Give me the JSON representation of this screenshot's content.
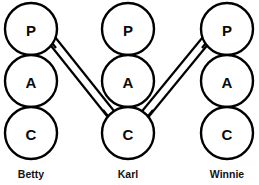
{
  "diagram": {
    "type": "transactional-analysis-ego-state-diagram",
    "background_color": "#ffffff",
    "stroke_color": "#000000",
    "width": 259,
    "height": 185,
    "circle_radius": 26,
    "columns": [
      {
        "id": "betty",
        "label": "Betty",
        "center_x": 31,
        "label_x": 31,
        "label_y": 178,
        "states": [
          {
            "code": "P",
            "name": "parent",
            "cx": 31,
            "cy": 29
          },
          {
            "code": "A",
            "name": "adult",
            "cx": 31,
            "cy": 81
          },
          {
            "code": "C",
            "name": "child",
            "cx": 31,
            "cy": 133
          }
        ]
      },
      {
        "id": "karl",
        "label": "Karl",
        "center_x": 128,
        "label_x": 128,
        "label_y": 178,
        "states": [
          {
            "code": "P",
            "name": "parent",
            "cx": 128,
            "cy": 29
          },
          {
            "code": "A",
            "name": "adult",
            "cx": 128,
            "cy": 81
          },
          {
            "code": "C",
            "name": "child",
            "cx": 128,
            "cy": 133
          }
        ]
      },
      {
        "id": "winnie",
        "label": "Winnie",
        "center_x": 227,
        "label_x": 227,
        "label_y": 178,
        "states": [
          {
            "code": "P",
            "name": "parent",
            "cx": 227,
            "cy": 29
          },
          {
            "code": "A",
            "name": "adult",
            "cx": 227,
            "cy": 81
          },
          {
            "code": "C",
            "name": "child",
            "cx": 227,
            "cy": 133
          }
        ]
      }
    ],
    "transactions": [
      {
        "id": "betty-parent-karl-child",
        "from": "betty.P",
        "to": "karl.C",
        "style": "double-line",
        "arrowheads": "both",
        "stimulus_label": "",
        "response_label": ""
      },
      {
        "id": "winnie-parent-karl-child",
        "from": "winnie.P",
        "to": "karl.C",
        "style": "double-line",
        "arrowheads": "both",
        "stimulus_label": "",
        "response_label": ""
      }
    ]
  }
}
